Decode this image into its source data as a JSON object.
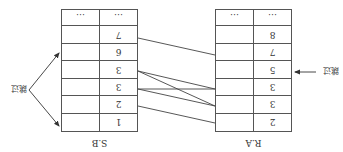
{
  "figure": {
    "orientation": "rotated-180",
    "caption_clipped": ""
  },
  "tables": {
    "left": {
      "name": "R.A",
      "rows": [
        {
          "value": "2",
          "other": ""
        },
        {
          "value": "3",
          "other": ""
        },
        {
          "value": "3",
          "other": ""
        },
        {
          "value": "5",
          "other": ""
        },
        {
          "value": "7",
          "other": ""
        },
        {
          "value": "8",
          "other": ""
        },
        {
          "value": "…",
          "other": "…"
        }
      ]
    },
    "right": {
      "name": "S.B",
      "rows": [
        {
          "value": "1",
          "other": ""
        },
        {
          "value": "2",
          "other": ""
        },
        {
          "value": "3",
          "other": ""
        },
        {
          "value": "3",
          "other": ""
        },
        {
          "value": "6",
          "other": ""
        },
        {
          "value": "7",
          "other": ""
        },
        {
          "value": "…",
          "other": "…"
        }
      ]
    }
  },
  "links": [
    {
      "from": "R.A:2",
      "to": "S.B:2"
    },
    {
      "from": "R.A:3",
      "to": "S.B:3"
    },
    {
      "from": "R.A:3",
      "to": "S.B:3"
    },
    {
      "from": "R.A:3",
      "to": "S.B:3"
    },
    {
      "from": "R.A:3",
      "to": "S.B:3"
    },
    {
      "from": "R.A:7",
      "to": "S.B:7"
    }
  ],
  "annotations": {
    "skip_left": "跳过",
    "skip_right": "跳过"
  },
  "colors": {
    "line": "#444444",
    "border": "#555555",
    "text": "#333333"
  }
}
